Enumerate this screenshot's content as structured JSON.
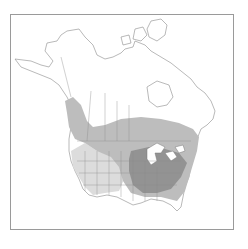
{
  "map": {
    "subject": "North America range map",
    "colors": {
      "background": "#ffffff",
      "land": "#ffffff",
      "outline": "#8a8a8a",
      "range_light": "#dcdcdc",
      "range_medium": "#bdbdbd",
      "range_dark": "#939393",
      "water": "#ffffff",
      "frame": "#9a9a9a"
    },
    "legend": []
  }
}
